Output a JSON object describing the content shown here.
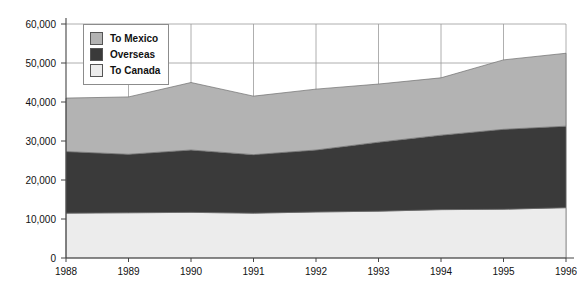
{
  "chart_data": {
    "type": "area",
    "stacked": true,
    "title": "",
    "subtitle": "",
    "xlabel": "",
    "ylabel": "",
    "categories": [
      "1988",
      "1989",
      "1990",
      "1991",
      "1992",
      "1993",
      "1994",
      "1995",
      "1996"
    ],
    "x": [
      1988,
      1989,
      1990,
      1991,
      1992,
      1993,
      1994,
      1995,
      1996
    ],
    "series": [
      {
        "name": "To Canada",
        "color": "#ececec",
        "values": [
          11500,
          11600,
          11700,
          11500,
          11800,
          12000,
          12400,
          12500,
          12900
        ]
      },
      {
        "name": "Overseas",
        "color": "#3a3a3a",
        "values": [
          15800,
          15000,
          16000,
          15000,
          15900,
          17700,
          19100,
          20500,
          20900
        ]
      },
      {
        "name": "To Mexico",
        "color": "#b3b3b3",
        "values": [
          13700,
          14700,
          17300,
          15000,
          15600,
          14900,
          14700,
          17800,
          18700
        ]
      }
    ],
    "cumulative_totals": [
      41000,
      41300,
      45000,
      41500,
      43300,
      44600,
      46200,
      50800,
      52500
    ],
    "stack_order": [
      "To Canada",
      "Overseas",
      "To Mexico"
    ],
    "ylim": [
      0,
      60000
    ],
    "ytick_values": [
      0,
      10000,
      20000,
      30000,
      40000,
      50000,
      60000
    ],
    "ytick_labels": [
      "0",
      "10,000",
      "20,000",
      "30,000",
      "40,000",
      "50,000",
      "60,000"
    ],
    "xtick_labels": [
      "1988",
      "1989",
      "1990",
      "1991",
      "1992",
      "1993",
      "1994",
      "1995",
      "1996"
    ],
    "grid": "horizontal-and-vertical",
    "legend_position": "top-left-inside",
    "legend_entries": [
      {
        "label": "To Mexico",
        "color": "#b3b3b3"
      },
      {
        "label": "Overseas",
        "color": "#3a3a3a"
      },
      {
        "label": "To Canada",
        "color": "#ececec"
      }
    ]
  }
}
